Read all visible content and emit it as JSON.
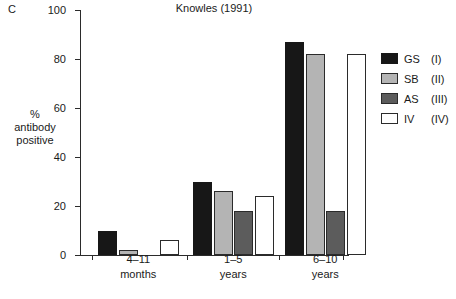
{
  "panel_label": "C",
  "legend": {
    "position": "right",
    "entries": [
      {
        "name": "GS",
        "roman": "(I)",
        "color": "#171717"
      },
      {
        "name": "SB",
        "roman": "(II)",
        "color": "#b4b4b4"
      },
      {
        "name": "AS",
        "roman": "(III)",
        "color": "#5c5c5c"
      },
      {
        "name": "IV",
        "roman": "(IV)",
        "color": "#ffffff"
      }
    ]
  },
  "chart_data": {
    "type": "bar",
    "title": "Knowles (1991)",
    "xlabel": "",
    "ylabel": "%\nantibody\npositive",
    "ylabel_lines": [
      "%",
      "antibody",
      "positive"
    ],
    "categories": [
      "4–11\nmonths",
      "1–5\nyears",
      "6–10\nyears"
    ],
    "category_lines": [
      [
        "4–11",
        "months"
      ],
      [
        "1–5",
        "years"
      ],
      [
        "6–10",
        "years"
      ]
    ],
    "series": [
      {
        "name": "GS (I)",
        "color": "#171717",
        "values": [
          10,
          30,
          87
        ]
      },
      {
        "name": "SB (II)",
        "color": "#b4b4b4",
        "values": [
          2,
          26,
          82
        ]
      },
      {
        "name": "AS (III)",
        "color": "#5c5c5c",
        "values": [
          0,
          18,
          18
        ]
      },
      {
        "name": "IV (IV)",
        "color": "#ffffff",
        "values": [
          6,
          24,
          82
        ]
      }
    ],
    "ylim": [
      0,
      100
    ],
    "yticks": [
      0,
      20,
      40,
      60,
      80,
      100
    ],
    "ytick_labels": [
      "0",
      "20",
      "40",
      "60",
      "80",
      "100"
    ],
    "grid": false,
    "legend_position": "right"
  }
}
